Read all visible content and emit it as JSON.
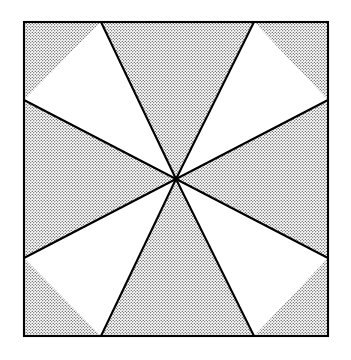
{
  "figure": {
    "canvas": {
      "width": 351,
      "height": 360,
      "background": "#ffffff"
    },
    "stroke": {
      "color": "#000000",
      "width": 2.1,
      "linejoin": "miter"
    },
    "fill": {
      "shaded_name": "stipple-dots",
      "shaded_dot_color": "#1a1a1a",
      "shaded_background": "#ffffff",
      "shaded_dot_radius": 0.62,
      "shaded_dot_spacing": 3.0,
      "unshaded_color": "#ffffff"
    },
    "square": {
      "name": "outer-square",
      "left": 24,
      "top": 22,
      "right": 328,
      "bottom": 336,
      "width": 304,
      "height": 314
    },
    "center_point": {
      "name": "pinwheel-center",
      "x": 176,
      "y": 179
    },
    "edge_vertices": [
      {
        "name": "top-left-notch",
        "edge": "top",
        "x": 101,
        "y": 22
      },
      {
        "name": "top-right-notch",
        "edge": "top",
        "x": 254,
        "y": 22
      },
      {
        "name": "right-upper-notch",
        "edge": "right",
        "x": 328,
        "y": 100
      },
      {
        "name": "right-lower-notch",
        "edge": "right",
        "x": 328,
        "y": 258
      },
      {
        "name": "bottom-right-notch",
        "edge": "bottom",
        "x": 254,
        "y": 336
      },
      {
        "name": "bottom-left-notch",
        "edge": "bottom",
        "x": 101,
        "y": 336
      },
      {
        "name": "left-lower-notch",
        "edge": "left",
        "x": 24,
        "y": 258
      },
      {
        "name": "left-upper-notch",
        "edge": "left",
        "x": 24,
        "y": 100
      }
    ],
    "corners": [
      {
        "name": "corner-top-left",
        "x": 24,
        "y": 22
      },
      {
        "name": "corner-top-right",
        "x": 328,
        "y": 22
      },
      {
        "name": "corner-bottom-right",
        "x": 328,
        "y": 336
      },
      {
        "name": "corner-bottom-left",
        "x": 24,
        "y": 336
      }
    ],
    "white_triangles": [
      {
        "name": "white-triangle-top-left",
        "points": "24,100 101,22 176,179"
      },
      {
        "name": "white-triangle-top-right",
        "points": "254,22 328,100 176,179"
      },
      {
        "name": "white-triangle-bottom-right",
        "points": "328,258 254,336 176,179"
      },
      {
        "name": "white-triangle-bottom-left",
        "points": "101,336 24,258 176,179"
      }
    ],
    "shaded_regions": [
      {
        "name": "shaded-region-top",
        "points": "101,22 254,22 176,179"
      },
      {
        "name": "shaded-region-right",
        "points": "328,100 328,258 176,179"
      },
      {
        "name": "shaded-region-bottom",
        "points": "254,336 101,336 176,179"
      },
      {
        "name": "shaded-region-left",
        "points": "24,258 24,100 176,179"
      },
      {
        "name": "shaded-corner-top-left",
        "points": "24,22 101,22 176,179 24,100"
      },
      {
        "name": "shaded-corner-top-right",
        "points": "254,22 328,22 328,100 176,179"
      },
      {
        "name": "shaded-corner-bottom-right",
        "points": "176,179 328,258 328,336 254,336"
      },
      {
        "name": "shaded-corner-bottom-left",
        "points": "24,258 176,179 101,336 24,336"
      }
    ],
    "spokes": [
      {
        "name": "spoke-to-top-left-notch",
        "x1": 176,
        "y1": 179,
        "x2": 101,
        "y2": 22
      },
      {
        "name": "spoke-to-top-right-notch",
        "x1": 176,
        "y1": 179,
        "x2": 254,
        "y2": 22
      },
      {
        "name": "spoke-to-right-upper-notch",
        "x1": 176,
        "y1": 179,
        "x2": 328,
        "y2": 100
      },
      {
        "name": "spoke-to-right-lower-notch",
        "x1": 176,
        "y1": 179,
        "x2": 328,
        "y2": 258
      },
      {
        "name": "spoke-to-bottom-right-notch",
        "x1": 176,
        "y1": 179,
        "x2": 254,
        "y2": 336
      },
      {
        "name": "spoke-to-bottom-left-notch",
        "x1": 176,
        "y1": 179,
        "x2": 101,
        "y2": 336
      },
      {
        "name": "spoke-to-left-lower-notch",
        "x1": 176,
        "y1": 179,
        "x2": 24,
        "y2": 258
      },
      {
        "name": "spoke-to-left-upper-notch",
        "x1": 176,
        "y1": 179,
        "x2": 24,
        "y2": 100
      }
    ]
  }
}
